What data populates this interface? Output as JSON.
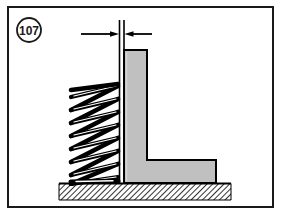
{
  "figure": {
    "number_label": "107",
    "frame": {
      "border_color": "#000000",
      "background_color": "#ffffff",
      "x": 8,
      "y": 7,
      "width": 265,
      "height": 200,
      "stroke_width": 2
    },
    "callout": {
      "name": "figure-number-callout",
      "shape": "circle",
      "text": "107",
      "center_x": 29,
      "center_y": 30,
      "radius": 12,
      "stroke_color": "#000000",
      "fill_color": "#ffffff"
    },
    "dimension": {
      "name": "clearance-dimension",
      "label": "",
      "arrow_y": 34,
      "left_arrow_tail_x": 81,
      "left_arrow_head_x": 117,
      "right_arrow_tail_x": 152,
      "right_arrow_head_x": 124,
      "extension_line_1_x": 119,
      "extension_line_2_x": 124,
      "extension_line_top_y": 20,
      "extension_line_bottom_y": 183,
      "color": "#000000"
    },
    "spring": {
      "name": "compression-spring",
      "coil_count": 8,
      "left_x": 70,
      "right_x": 119,
      "top_y": 84,
      "bottom_y": 183,
      "wire_color": "#000000",
      "wire_highlight_color": "#ffffff",
      "wire_thickness": 5
    },
    "bracket": {
      "name": "l-shaped-bracket",
      "fill_color": "#c0c0c0",
      "stroke_color": "#000000",
      "vertical_left_x": 124,
      "vertical_right_x": 147,
      "vertical_top_y": 50,
      "foot_top_y": 160,
      "foot_right_x": 216,
      "base_y": 183
    },
    "ground": {
      "name": "hatched-ground",
      "x": 59,
      "y": 183,
      "width": 172,
      "height": 17,
      "hatch_color": "#000000",
      "fill_color": "#ffffff",
      "hatch_angle_deg": 45,
      "top_line_color": "#000000"
    }
  }
}
